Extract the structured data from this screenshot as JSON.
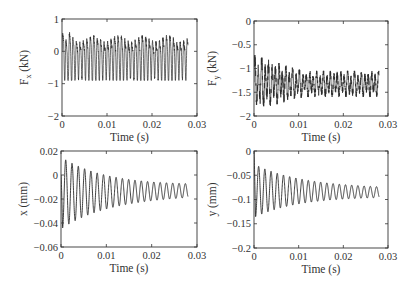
{
  "chart_data": [
    {
      "type": "line",
      "panel": "top-left",
      "title": "",
      "xlabel": "Time (s)",
      "ylabel": "F_x (kN)",
      "ylabel_main": "F",
      "ylabel_sub": "x",
      "ylabel_unit": " (kN)",
      "xlim": [
        0,
        0.03
      ],
      "ylim": [
        -2,
        1
      ],
      "xticks": [
        0,
        0.01,
        0.02,
        0.03
      ],
      "xtick_labels": [
        "0",
        "0.01",
        "0.02",
        "0.03"
      ],
      "yticks": [
        1,
        0,
        -1,
        -2
      ],
      "ytick_labels": [
        "1",
        "0",
        "−1",
        "−2"
      ],
      "grid": false,
      "series": [
        {
          "name": "Fx",
          "description": "dense high-frequency cutting force oscillation",
          "t_end": 0.028,
          "mean": -0.18,
          "amplitude_start": 0.75,
          "amplitude_end": 0.65,
          "upper_envelope": 0.5,
          "lower_envelope": -0.85,
          "peak_max": 0.8,
          "sample_x": [
            0,
            0.001,
            0.002,
            0.005,
            0.01,
            0.015,
            0.02,
            0.025,
            0.028
          ],
          "sample_y": [
            -0.3,
            0.8,
            -0.9,
            0.55,
            -0.8,
            0.5,
            -0.75,
            0.5,
            -0.4
          ]
        }
      ]
    },
    {
      "type": "line",
      "panel": "top-right",
      "title": "",
      "xlabel": "Time (s)",
      "ylabel": "F_y (kN)",
      "ylabel_main": "F",
      "ylabel_sub": "y",
      "ylabel_unit": " (kN)",
      "xlim": [
        0,
        0.03
      ],
      "ylim": [
        -2,
        0
      ],
      "xticks": [
        0,
        0.01,
        0.02,
        0.03
      ],
      "xtick_labels": [
        "0",
        "0.01",
        "0.02",
        "0.03"
      ],
      "yticks": [
        0,
        -0.5,
        -1,
        -1.5,
        -2
      ],
      "ytick_labels": [
        "0",
        "−0.5",
        "−1",
        "−1.5",
        "−2"
      ],
      "grid": false,
      "series": [
        {
          "name": "Fy",
          "description": "noisy oscillation around -1.35 kN, larger early spikes",
          "t_end": 0.028,
          "mean": -1.35,
          "upper_envelope_start": -0.72,
          "upper_envelope_end": -1.05,
          "lower_envelope_start": -1.88,
          "lower_envelope_end": -1.6,
          "sample_x": [
            0,
            0.001,
            0.002,
            0.003,
            0.005,
            0.01,
            0.015,
            0.02,
            0.025,
            0.028
          ],
          "sample_y": [
            -1.2,
            -0.75,
            -1.85,
            -0.72,
            -1.75,
            -0.95,
            -1.65,
            -1.05,
            -1.6,
            -1.3
          ]
        }
      ]
    },
    {
      "type": "line",
      "panel": "bottom-left",
      "title": "",
      "xlabel": "Time (s)",
      "ylabel": "x (mm)",
      "xlim": [
        0,
        0.03
      ],
      "ylim": [
        -0.06,
        0.02
      ],
      "xticks": [
        0,
        0.01,
        0.02,
        0.03
      ],
      "xtick_labels": [
        "0",
        "0.01",
        "0.02",
        "0.03"
      ],
      "yticks": [
        0.02,
        0,
        -0.02,
        -0.04,
        -0.06
      ],
      "ytick_labels": [
        "0.02",
        "0",
        "−0.02",
        "−0.04",
        "−0.06"
      ],
      "grid": false,
      "series": [
        {
          "name": "x",
          "description": "decaying oscillation (~720 Hz) settling near -0.013 mm",
          "t_end": 0.028,
          "frequency_hz": 720,
          "mean_start": -0.015,
          "mean_end": -0.013,
          "amplitude_start": 0.03,
          "amplitude_end": 0.004,
          "sample_x": [
            0,
            0.0008,
            0.0015,
            0.003,
            0.006,
            0.01,
            0.015,
            0.02,
            0.025,
            0.028
          ],
          "sample_y": [
            0,
            -0.045,
            0.013,
            0.006,
            0.004,
            0.0,
            -0.003,
            -0.008,
            -0.009,
            -0.011
          ]
        }
      ]
    },
    {
      "type": "line",
      "panel": "bottom-right",
      "title": "",
      "xlabel": "Time (s)",
      "ylabel": "y (mm)",
      "xlim": [
        0,
        0.03
      ],
      "ylim": [
        -0.2,
        0
      ],
      "xticks": [
        0,
        0.01,
        0.02,
        0.03
      ],
      "xtick_labels": [
        "0",
        "0.01",
        "0.02",
        "0.03"
      ],
      "yticks": [
        0,
        -0.05,
        -0.1,
        -0.15,
        -0.2
      ],
      "ytick_labels": [
        "0",
        "−0.05",
        "−0.1",
        "−0.15",
        "−0.2"
      ],
      "grid": false,
      "series": [
        {
          "name": "y",
          "description": "decaying oscillation (~720 Hz) settling near -0.085 mm",
          "t_end": 0.028,
          "frequency_hz": 720,
          "mean_start": -0.082,
          "mean_end": -0.085,
          "amplitude_start": 0.055,
          "amplitude_end": 0.008,
          "sample_x": [
            0,
            0.0008,
            0.003,
            0.006,
            0.01,
            0.015,
            0.02,
            0.025,
            0.028
          ],
          "sample_y": [
            0,
            -0.13,
            -0.025,
            -0.04,
            -0.05,
            -0.06,
            -0.07,
            -0.075,
            -0.088
          ]
        }
      ]
    }
  ],
  "figure": {
    "line_color": "#2a2a2a",
    "axes_color": "#333333",
    "background": "#ffffff"
  }
}
